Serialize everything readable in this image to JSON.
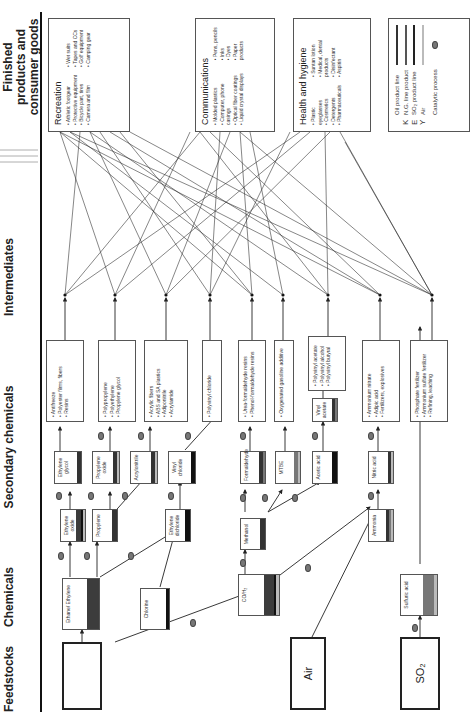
{
  "headers": {
    "feedstocks": "Feedstocks",
    "chemicals": "Chemicals",
    "secondary": "Secondary chemicals",
    "intermediates": "Intermediates",
    "finished_line1": "Finished",
    "finished_line2": "products and consumer goods"
  },
  "feedstocks": [
    {
      "label": "N.G.",
      "color": "#3c3c3c"
    },
    {
      "label": "Air",
      "color": "#c8c8c8"
    },
    {
      "label": "SO₂",
      "color": "#888888"
    }
  ],
  "chemicals": [
    {
      "label": "Ethane/ Ethylene"
    },
    {
      "label": "Chlorine"
    },
    {
      "label": "CO/H₂"
    },
    {
      "label": "Sulfuric acid"
    }
  ],
  "secondary_chemicals": [
    {
      "label": "Ethylene oxide"
    },
    {
      "label": "Propylene"
    },
    {
      "label": "Ethylene dichloride"
    },
    {
      "label": "Methanol"
    },
    {
      "label": "Ammonia"
    },
    {
      "label": "Ethylene glycol"
    },
    {
      "label": "Propylene oxide"
    },
    {
      "label": "Acrylonitrile"
    },
    {
      "label": "Vinyl chloride"
    },
    {
      "label": "Formaldehyde"
    },
    {
      "label": "MTBE"
    },
    {
      "label": "Acetic acid"
    },
    {
      "label": "Vinyl acetate"
    },
    {
      "label": "Nitric acid"
    }
  ],
  "intermediates": [
    {
      "items": [
        "Antifreeze",
        "Polyester films, fibers",
        "Resins"
      ]
    },
    {
      "items": [
        "Polypropylene",
        "Polyethylene",
        "Propylene glycol"
      ]
    },
    {
      "items": [
        "Acrylic fibers",
        "ABS and SA plastics",
        "Adiponitrile",
        "Acrylamide"
      ]
    },
    {
      "items": [
        "Polyvinyl chloride"
      ]
    },
    {
      "items": [
        "Urea-formaldehyde resins",
        "Phenol-formaldehyde resins"
      ]
    },
    {
      "items": [
        "Oxygenated gasoline additive"
      ]
    },
    {
      "items": [
        "Polyvinyl acetate",
        "Polyvinyl alcohol",
        "Polyvinyl butyral"
      ]
    },
    {
      "items": [
        "Ammonium nitrate",
        "Adipic acid",
        "Fertilizers, explosives"
      ]
    },
    {
      "items": [
        "Phosphate fertilizer",
        "Ammonium sulfate fertilizer",
        "Refining, leaching"
      ]
    }
  ],
  "finished_products": [
    {
      "title": "Recreation",
      "col1": [
        "Athletic footgear",
        "Protective equipment",
        "Bicycle part, tires",
        "Camera and film"
      ],
      "col2": [
        "Wet suits",
        "Tapes and CCs",
        "Golf equipment",
        "Camping gear"
      ]
    },
    {
      "title": "Communications",
      "col1": [
        "Molded plastics",
        "Computer, phone casings",
        "Optical fiber coatings",
        "Liquid crystal displays"
      ],
      "col2": [
        "Pens, pencils",
        "Inks",
        "Dyes",
        "Paper products"
      ]
    },
    {
      "title": "Health and hygiene",
      "col1": [
        "Plastic eyeglasses",
        "Cosmetics",
        "Detergents",
        "Pharmaceuticals"
      ],
      "col2": [
        "Suntan lotion",
        "Medical, dental products",
        "Disinfectant",
        "Aspirin"
      ]
    }
  ],
  "legend": {
    "items": [
      {
        "key": "",
        "label": "Oil product line",
        "color": "#333333"
      },
      {
        "key": "K",
        "label": "N.G. line product",
        "color": "#555555"
      },
      {
        "key": "E",
        "label": "SO₂ product line",
        "color": "#222222"
      },
      {
        "key": "Y",
        "label": "Air",
        "color": "#bbbbbb"
      }
    ],
    "catalytic_label": "Catalytic process"
  },
  "colors": {
    "oil": "#333333",
    "ng": "#3c3c3c",
    "so2": "#777777",
    "air": "#c8c8c8",
    "black": "#111111"
  }
}
